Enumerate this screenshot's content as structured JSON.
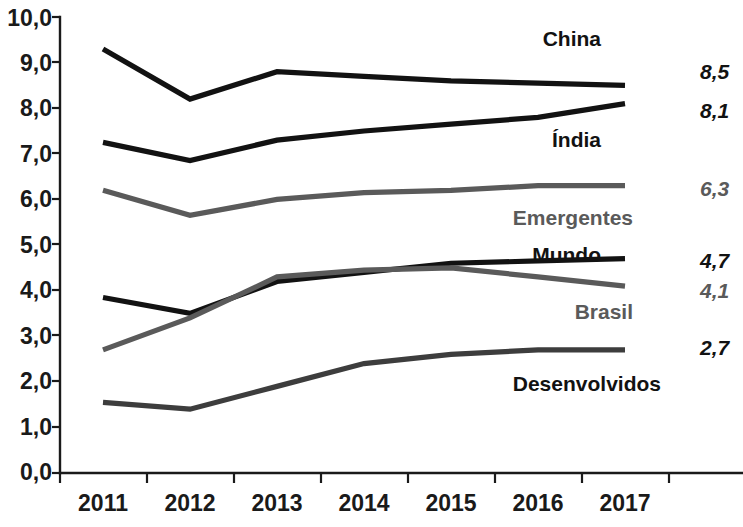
{
  "chart_data": {
    "type": "line",
    "title": "",
    "subtitle": "",
    "xlabel": "",
    "ylabel": "",
    "categories": [
      "2011",
      "2012",
      "2013",
      "2014",
      "2015",
      "2016",
      "2017"
    ],
    "x": [
      2011,
      2012,
      2013,
      2014,
      2015,
      2016,
      2017
    ],
    "ylim": [
      0.0,
      10.0
    ],
    "ytick_step": 1.0,
    "ytick_labels": [
      "0,0",
      "1,0",
      "2,0",
      "3,0",
      "4,0",
      "5,0",
      "6,0",
      "7,0",
      "8,0",
      "9,0",
      "10,0"
    ],
    "ytick_values": [
      0.0,
      1.0,
      2.0,
      3.0,
      4.0,
      5.0,
      6.0,
      7.0,
      8.0,
      9.0,
      10.0
    ],
    "grid": false,
    "legend_position": "inline-right",
    "decimal_separator": ",",
    "series": [
      {
        "name": "China",
        "color": "#121212",
        "end_value_label": "8,5",
        "values": [
          9.3,
          8.2,
          8.8,
          8.7,
          8.6,
          8.55,
          8.5
        ]
      },
      {
        "name": "Índia",
        "color": "#121212",
        "end_value_label": "8,1",
        "values": [
          7.25,
          6.85,
          7.3,
          7.5,
          7.65,
          7.8,
          8.1
        ]
      },
      {
        "name": "Emergentes",
        "color": "#5a5a5a",
        "end_value_label": "6,3",
        "values": [
          6.2,
          5.65,
          6.0,
          6.15,
          6.2,
          6.3,
          6.3
        ]
      },
      {
        "name": "Mundo",
        "color": "#121212",
        "end_value_label": "4,7",
        "values": [
          3.85,
          3.5,
          4.2,
          4.4,
          4.6,
          4.65,
          4.7
        ]
      },
      {
        "name": "Brasil",
        "color": "#5a5a5a",
        "end_value_label": "4,1",
        "values": [
          2.7,
          3.4,
          4.3,
          4.45,
          4.5,
          4.3,
          4.1
        ]
      },
      {
        "name": "Desenvolvidos",
        "color": "#3d3d3d",
        "end_value_label": "2,7",
        "values": [
          1.55,
          1.4,
          1.9,
          2.4,
          2.6,
          2.7,
          2.7
        ]
      }
    ],
    "annotations": [
      {
        "text": "China",
        "value": "8,5"
      },
      {
        "text": "Índia",
        "value": "8,1"
      },
      {
        "text": "Emergentes",
        "value": "6,3"
      },
      {
        "text": "Mundo",
        "value": "4,7"
      },
      {
        "text": "Brasil",
        "value": "4,1"
      },
      {
        "text": "Desenvolvidos",
        "value": "2,7"
      }
    ]
  },
  "labels": {
    "china": "China",
    "india": "Índia",
    "emergentes": "Emergentes",
    "mundo": "Mundo",
    "brasil": "Brasil",
    "desenvolvidos": "Desenvolvidos"
  },
  "values": {
    "china": "8,5",
    "india": "8,1",
    "emergentes": "6,3",
    "mundo": "4,7",
    "brasil": "4,1",
    "desenvolvidos": "2,7"
  },
  "yticks": {
    "t10": "10,0",
    "t9": "9,0",
    "t8": "8,0",
    "t7": "7,0",
    "t6": "6,0",
    "t5": "5,0",
    "t4": "4,0",
    "t3": "3,0",
    "t2": "2,0",
    "t1": "1,0",
    "t0": "0,0"
  },
  "xticks": {
    "x0": "2011",
    "x1": "2012",
    "x2": "2013",
    "x3": "2014",
    "x4": "2015",
    "x5": "2016",
    "x6": "2017"
  }
}
